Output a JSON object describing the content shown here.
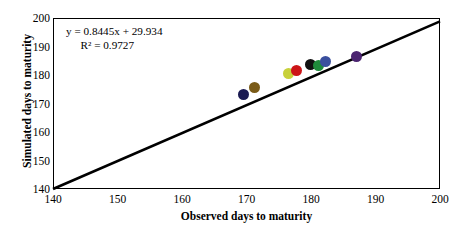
{
  "chart_data": {
    "type": "scatter",
    "title": "",
    "xlabel": "Observed days to maturity",
    "ylabel": "Simulated days to maturity",
    "xlim": [
      140,
      200
    ],
    "ylim": [
      140,
      200
    ],
    "xticks": [
      140,
      150,
      160,
      170,
      180,
      190,
      200
    ],
    "yticks": [
      140,
      150,
      160,
      170,
      180,
      190,
      200
    ],
    "grid": false,
    "legend": false,
    "annotations": {
      "equation": "y = 0.8445x + 29.934",
      "r_squared": "R² = 0.9727",
      "slope": 0.8445,
      "intercept": 29.934,
      "r2": 0.9727
    },
    "reference_line": {
      "name": "regression-line",
      "from": [
        140,
        140
      ],
      "to": [
        200,
        198.8
      ],
      "color": "#000000",
      "width": 2.6
    },
    "points": [
      {
        "label": "point-1",
        "x": 169.6,
        "y": 173.2,
        "color": "#1a1a52"
      },
      {
        "label": "point-2",
        "x": 171.2,
        "y": 175.6,
        "color": "#7a5b18"
      },
      {
        "label": "point-3",
        "x": 176.5,
        "y": 180.5,
        "color": "#c8d13a"
      },
      {
        "label": "point-4",
        "x": 177.8,
        "y": 181.5,
        "color": "#cc1417"
      },
      {
        "label": "point-5",
        "x": 179.9,
        "y": 183.6,
        "color": "#111111"
      },
      {
        "label": "point-6",
        "x": 181.2,
        "y": 183.2,
        "color": "#1f8a3b"
      },
      {
        "label": "point-7",
        "x": 182.3,
        "y": 184.6,
        "color": "#3a4f9e"
      },
      {
        "label": "point-8",
        "x": 187.0,
        "y": 186.6,
        "color": "#4b2470"
      }
    ]
  },
  "axes": {
    "y_tick_labels": [
      "200",
      "190",
      "180",
      "170",
      "160",
      "150",
      "140"
    ],
    "x_tick_labels": [
      "140",
      "150",
      "160",
      "170",
      "180",
      "190",
      "200"
    ],
    "x_title": "Observed days to maturity",
    "y_title": "Simulated days to maturity"
  },
  "annotation": {
    "line1": "y = 0.8445x + 29.934",
    "line2": "R² = 0.9727"
  },
  "colors": {
    "axis": "#000000",
    "background": "#ffffff",
    "line": "#000000"
  }
}
